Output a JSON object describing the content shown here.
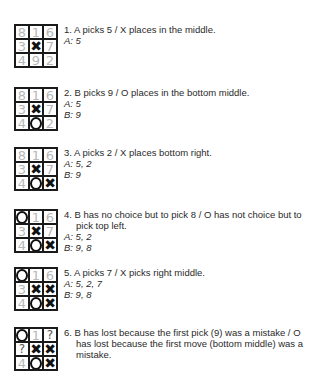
{
  "colors": {
    "grid": "#1a1a1a",
    "placeholder_number": "#b8b8b8",
    "mark": "#111111",
    "text": "#2a2a2a"
  },
  "steps": [
    {
      "top": 24,
      "board": [
        "8",
        "1",
        "6",
        "3",
        "X",
        "7",
        "4",
        "9",
        "2"
      ],
      "description": "1. A picks 5 / X places in the middle.",
      "scores": [
        "A: 5"
      ]
    },
    {
      "top": 87,
      "board": [
        "8",
        "1",
        "6",
        "3",
        "X",
        "7",
        "4",
        "O",
        "2"
      ],
      "description": "2. B picks 9 / O places in the bottom middle.",
      "scores": [
        "A: 5",
        "B: 9"
      ]
    },
    {
      "top": 147,
      "board": [
        "8",
        "1",
        "6",
        "3",
        "X",
        "7",
        "4",
        "O",
        "X"
      ],
      "description": "3.  A picks 2 / X places bottom right.",
      "scores": [
        "A: 5, 2",
        "B: 9"
      ]
    },
    {
      "top": 209,
      "board": [
        "O",
        "1",
        "6",
        "3",
        "X",
        "7",
        "4",
        "O",
        "X"
      ],
      "description": "4.  B has no choice but to pick 8 / O has not choice but to pick top left.",
      "scores": [
        "A: 5, 2",
        "B: 9, 8"
      ]
    },
    {
      "top": 267,
      "board": [
        "O",
        "1",
        "6",
        "3",
        "X",
        "X",
        "4",
        "O",
        "X"
      ],
      "description": "5.  A picks 7 / X picks right middle.",
      "scores": [
        "A: 5, 2, 7",
        "B: 9, 8"
      ]
    },
    {
      "top": 327,
      "board": [
        "O",
        "1",
        "?",
        "?",
        "X",
        "X",
        "4",
        "O",
        "X"
      ],
      "description": "6.  B has lost because the first pick (9) was a mistake / O has lost because the first move (bottom middle) was a mistake.",
      "scores": []
    }
  ]
}
